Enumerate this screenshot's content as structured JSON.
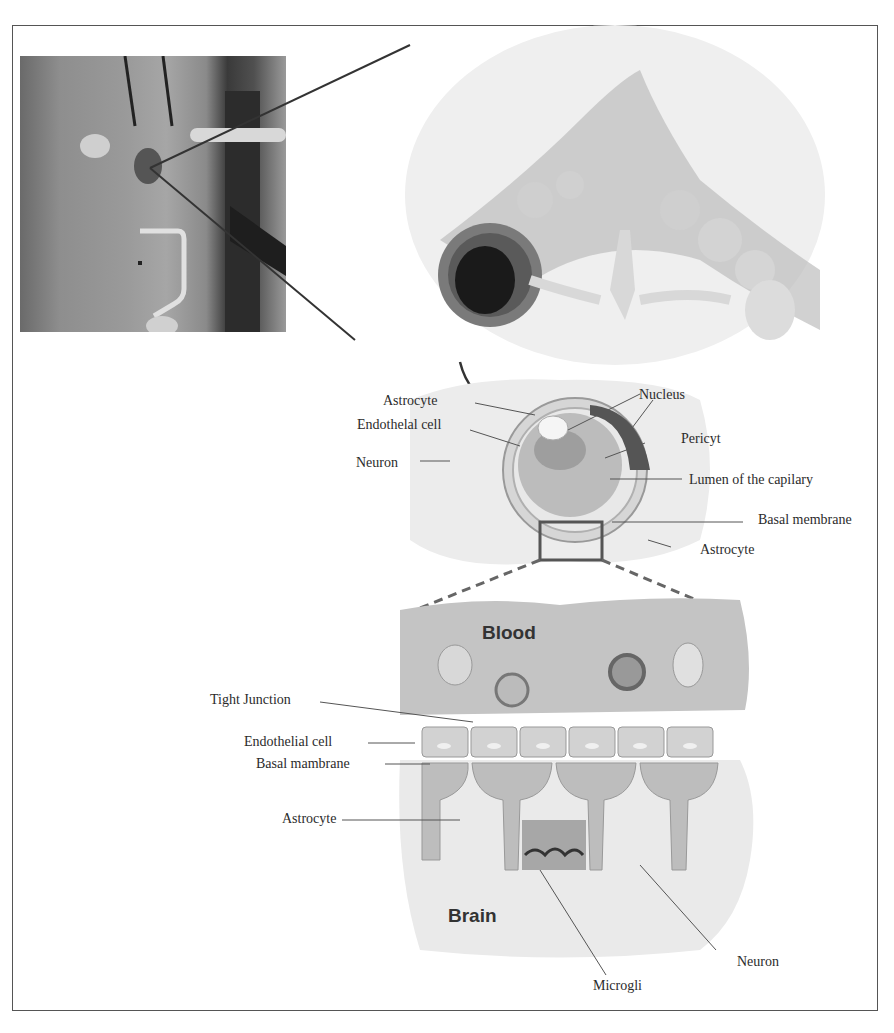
{
  "figure": {
    "panels": {
      "photo": {
        "description": "photograph of surgical site with probe"
      },
      "capillary_3d": {
        "description": "illustration of capillary surrounded by astrocytes and neurons"
      },
      "cross_section": {
        "labels": {
          "astrocyte_top": "Astrocyte",
          "endothelial": "Endothelal cell",
          "neuron": "Neuron",
          "nucleus": "Nucleus",
          "pericyte": "Pericyt",
          "lumen": "Lumen of the capilary",
          "basal_membrane": "Basal membrane",
          "astrocyte_bottom": "Astrocyte"
        }
      },
      "barrier_detail": {
        "regions": {
          "blood": "Blood",
          "brain": "Brain"
        },
        "labels": {
          "tight_junction": "Tight Junction",
          "endothelial": "Endothelial cell",
          "basal_membrane": "Basal mambrane",
          "astrocyte": "Astrocyte",
          "microglia": "Microgli",
          "neuron": "Neuron"
        }
      }
    }
  }
}
